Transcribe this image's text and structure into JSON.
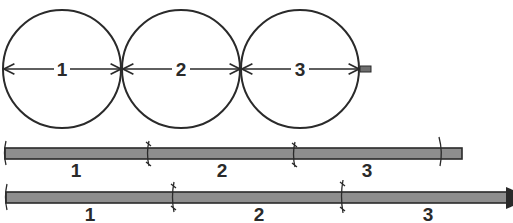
{
  "diagram": {
    "circles": [
      {
        "label": "1",
        "cx": 62,
        "cy": 69,
        "r": 59
      },
      {
        "label": "2",
        "cx": 181,
        "cy": 69,
        "r": 59
      },
      {
        "label": "3",
        "cx": 300,
        "cy": 69,
        "r": 59
      }
    ],
    "circle_end_tab": {
      "x": 360,
      "y": 66,
      "w": 11,
      "h": 6
    },
    "strip_top": {
      "labels": [
        "1",
        "2",
        "3"
      ],
      "x_start": 5,
      "x_end": 462,
      "y": 150,
      "height": 10,
      "ticks": [
        5,
        148,
        294,
        440
      ],
      "label_x": [
        76,
        222,
        367
      ],
      "label_y": 176
    },
    "strip_bottom": {
      "labels": [
        "1",
        "2",
        "3"
      ],
      "x_start": 6,
      "x_end": 510,
      "y": 193,
      "height": 10,
      "ticks": [
        6,
        174,
        343
      ],
      "label_x": [
        90,
        259,
        428
      ],
      "label_y": 221
    },
    "colors": {
      "stroke": "#2a2a2a",
      "strip_fill": "#8e8e8e",
      "background": "#ffffff"
    }
  }
}
